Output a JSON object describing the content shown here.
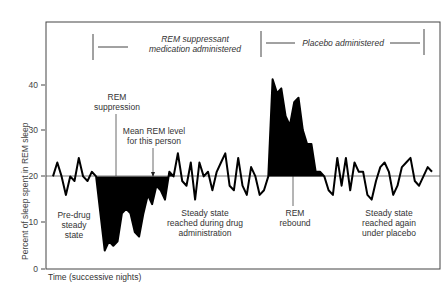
{
  "chart_data": {
    "type": "line",
    "title": "",
    "xlabel": "Time (successive nights)",
    "ylabel": "Percent of sleep spent in REM sleep",
    "ylim": [
      0,
      50
    ],
    "yticks": [
      0,
      10,
      20,
      30,
      40
    ],
    "mean_level": 20,
    "grid": false,
    "legend": null,
    "periods": [
      {
        "label": "REM suppressant medication administered",
        "start_night": 13,
        "end_night": 51
      },
      {
        "label": "Placebo administered",
        "start_night": 51,
        "end_night": 89
      }
    ],
    "series": [
      {
        "name": "REM sleep percent",
        "x": [
          1,
          2,
          3,
          4,
          5,
          6,
          7,
          8,
          9,
          10,
          11,
          12,
          13,
          14,
          15,
          16,
          17,
          18,
          19,
          20,
          21,
          22,
          23,
          24,
          25,
          26,
          27,
          28,
          29,
          30,
          31,
          32,
          33,
          34,
          35,
          36,
          37,
          38,
          39,
          40,
          41,
          42,
          43,
          44,
          45,
          46,
          47,
          48,
          49,
          50,
          51,
          52,
          53,
          54,
          55,
          56,
          57,
          58,
          59,
          60,
          61,
          62,
          63,
          64,
          65,
          66,
          67,
          68,
          69,
          70,
          71,
          72,
          73,
          74,
          75,
          76,
          77,
          78,
          79,
          80,
          81,
          82,
          83,
          84,
          85,
          86,
          87,
          88,
          89
        ],
        "values": [
          20,
          23,
          20,
          16,
          20,
          19,
          24,
          20,
          19,
          21,
          20,
          12,
          4,
          6,
          5,
          6,
          12,
          13,
          12,
          8,
          7,
          12,
          16,
          14,
          18,
          17,
          15,
          21,
          20,
          25,
          19,
          18,
          23,
          15,
          23,
          20,
          21,
          17,
          21,
          23,
          25,
          18,
          17,
          24,
          18,
          16,
          22,
          20,
          16,
          17,
          20,
          41,
          38,
          39,
          33,
          31,
          36,
          37,
          30,
          27,
          27,
          21,
          21,
          20,
          17,
          16,
          24,
          18,
          24,
          17,
          23,
          21,
          21,
          16,
          15,
          19,
          22,
          23,
          21,
          16,
          18,
          22,
          23,
          24,
          19,
          18,
          20,
          22,
          21
        ]
      }
    ],
    "annotations": [
      {
        "text": "REM suppression",
        "x_night": 20
      },
      {
        "text": "Mean REM level for this person",
        "x_night": 30
      },
      {
        "text": "Pre-drug steady state",
        "x_night": 6
      },
      {
        "text": "Steady state reached during drug administration",
        "x_night": 38
      },
      {
        "text": "REM rebound",
        "x_night": 57
      },
      {
        "text": "Steady state reached again under placebo",
        "x_night": 78
      }
    ]
  },
  "labels": {
    "period1_line1": "REM suppressant",
    "period1_line2": "medication administered",
    "period2": "Placebo administered",
    "rem_suppression_1": "REM",
    "rem_suppression_2": "suppression",
    "mean_level_1": "Mean REM level",
    "mean_level_2": "for this person",
    "predrug_1": "Pre-drug",
    "predrug_2": "steady",
    "predrug_3": "state",
    "steady_drug_1": "Steady state",
    "steady_drug_2": "reached during drug",
    "steady_drug_3": "administration",
    "rebound_1": "REM",
    "rebound_2": "rebound",
    "steady_placebo_1": "Steady state",
    "steady_placebo_2": "reached again",
    "steady_placebo_3": "under placebo",
    "xlabel": "Time (successive nights)",
    "ylabel": "Percent of sleep spent in REM sleep",
    "tick_0": "0",
    "tick_10": "10",
    "tick_20": "20",
    "tick_30": "30",
    "tick_40": "40"
  }
}
